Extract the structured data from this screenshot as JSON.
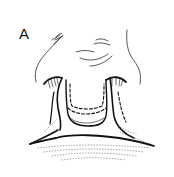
{
  "figure": {
    "panel_label": "A",
    "colors": {
      "ink": "#111111",
      "background": "#ffffff",
      "stipple": "#555555"
    }
  }
}
